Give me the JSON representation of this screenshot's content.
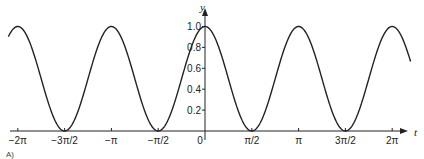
{
  "chart_data": {
    "type": "line",
    "title": "",
    "function": "y = cos^2(t)",
    "xlabel": "t",
    "ylabel": "y",
    "xlim": [
      -6.6,
      6.9
    ],
    "ylim": [
      0,
      1.05
    ],
    "grid": false,
    "legend": null,
    "x_ticks": [
      {
        "value": -6.2832,
        "label": "−2π"
      },
      {
        "value": -4.7124,
        "label": "−3π/2"
      },
      {
        "value": -3.1416,
        "label": "−π"
      },
      {
        "value": -1.5708,
        "label": "−π/2"
      },
      {
        "value": 0,
        "label": "0"
      },
      {
        "value": 1.5708,
        "label": "π/2"
      },
      {
        "value": 3.1416,
        "label": "π"
      },
      {
        "value": 4.7124,
        "label": "3π/2"
      },
      {
        "value": 6.2832,
        "label": "2π"
      }
    ],
    "y_ticks": [
      {
        "value": 0.2,
        "label": "0.2"
      },
      {
        "value": 0.4,
        "label": "0.4"
      },
      {
        "value": 0.6,
        "label": "0.6"
      },
      {
        "value": 0.8,
        "label": "0.8"
      },
      {
        "value": 1.0,
        "label": "1.0"
      }
    ],
    "series": [
      {
        "name": "cos²t",
        "x": [
          -6.6,
          -6.2832,
          -4.7124,
          -3.1416,
          -1.5708,
          0,
          1.5708,
          3.1416,
          4.7124,
          6.2832,
          6.6
        ],
        "values": [
          0.904,
          1.0,
          0.0,
          1.0,
          0.0,
          1.0,
          0.0,
          1.0,
          0.0,
          1.0,
          0.904
        ]
      }
    ]
  },
  "labels": {
    "x_axis": "t",
    "y_axis": "y",
    "origin": "0",
    "caption": "A)"
  }
}
